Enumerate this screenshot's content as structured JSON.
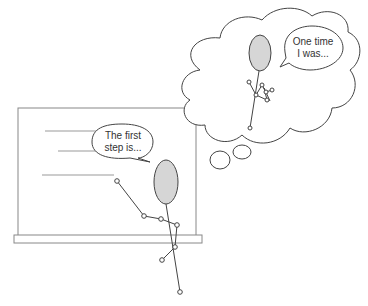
{
  "bubbles": {
    "teacher_line1": "The first",
    "teacher_line2": "step is...",
    "thought_line1": "One time",
    "thought_line2": "I was..."
  },
  "colors": {
    "stroke": "#444444",
    "head_fill": "#d6d6d6",
    "board": "#888888"
  }
}
